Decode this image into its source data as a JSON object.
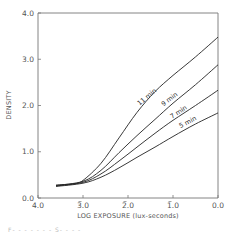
{
  "chart_data": {
    "type": "line",
    "title": "",
    "xlabel": "LOG EXPOSURE (lux-seconds)",
    "ylabel": "DENSITY",
    "xlim": [
      4.0,
      0.0
    ],
    "ylim": [
      0.0,
      4.0
    ],
    "x_reversed": true,
    "grid": false,
    "x_ticks": [
      {
        "value": 4.0,
        "label": "4.0",
        "bar": false
      },
      {
        "value": 3.0,
        "label": "3.0",
        "bar": true
      },
      {
        "value": 2.0,
        "label": "2.0",
        "bar": true
      },
      {
        "value": 1.0,
        "label": "1.0",
        "bar": true
      },
      {
        "value": 0.0,
        "label": "0.0",
        "bar": false
      }
    ],
    "y_ticks": [
      {
        "value": 0.0,
        "label": "0.0"
      },
      {
        "value": 1.0,
        "label": "1.0"
      },
      {
        "value": 2.0,
        "label": "2.0"
      },
      {
        "value": 3.0,
        "label": "3.0"
      },
      {
        "value": 4.0,
        "label": "4.0"
      }
    ],
    "legend_position": "inline labels on curves",
    "series": [
      {
        "name": "11 min",
        "label_at": [
          1.55,
          2.15
        ],
        "label_angle": -40,
        "points": [
          [
            3.6,
            0.28
          ],
          [
            3.2,
            0.31
          ],
          [
            3.0,
            0.38
          ],
          [
            2.6,
            0.75
          ],
          [
            2.2,
            1.3
          ],
          [
            1.8,
            1.85
          ],
          [
            1.4,
            2.3
          ],
          [
            1.0,
            2.65
          ],
          [
            0.5,
            3.05
          ],
          [
            0.0,
            3.48
          ]
        ]
      },
      {
        "name": "9 min",
        "label_at": [
          1.05,
          2.1
        ],
        "label_angle": -38,
        "points": [
          [
            3.6,
            0.27
          ],
          [
            3.0,
            0.36
          ],
          [
            2.6,
            0.6
          ],
          [
            2.2,
            0.98
          ],
          [
            1.8,
            1.35
          ],
          [
            1.4,
            1.7
          ],
          [
            1.0,
            2.05
          ],
          [
            0.5,
            2.45
          ],
          [
            0.0,
            2.88
          ]
        ]
      },
      {
        "name": "7 min",
        "label_at": [
          0.85,
          1.82
        ],
        "label_angle": -34,
        "points": [
          [
            3.6,
            0.26
          ],
          [
            3.0,
            0.34
          ],
          [
            2.6,
            0.52
          ],
          [
            2.2,
            0.8
          ],
          [
            1.8,
            1.1
          ],
          [
            1.4,
            1.4
          ],
          [
            1.0,
            1.68
          ],
          [
            0.5,
            2.0
          ],
          [
            0.0,
            2.33
          ]
        ]
      },
      {
        "name": "5 min",
        "label_at": [
          0.65,
          1.6
        ],
        "label_angle": -28,
        "points": [
          [
            3.6,
            0.25
          ],
          [
            3.0,
            0.32
          ],
          [
            2.6,
            0.45
          ],
          [
            2.2,
            0.65
          ],
          [
            1.8,
            0.88
          ],
          [
            1.4,
            1.1
          ],
          [
            1.0,
            1.33
          ],
          [
            0.5,
            1.6
          ],
          [
            0.0,
            1.84
          ]
        ]
      }
    ]
  },
  "footer_fragment": "F- - - - - - -  S- - - -"
}
